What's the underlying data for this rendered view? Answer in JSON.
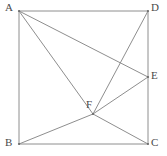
{
  "figure": {
    "width": 167,
    "height": 156,
    "stroke_color": "#8e8e8e",
    "label_color": "#4a4a4a",
    "background_color": "#ffffff"
  },
  "points": {
    "A": {
      "label": "A",
      "x": 19,
      "y": 11,
      "label_x": 5,
      "label_y": 2
    },
    "B": {
      "label": "B",
      "x": 19,
      "y": 144,
      "label_x": 5,
      "label_y": 137
    },
    "C": {
      "label": "C",
      "x": 148,
      "y": 144,
      "label_x": 151,
      "label_y": 137
    },
    "D": {
      "label": "D",
      "x": 148,
      "y": 11,
      "label_x": 151,
      "label_y": 2
    },
    "E": {
      "label": "E",
      "x": 148,
      "y": 77,
      "label_x": 151,
      "label_y": 70
    },
    "F": {
      "label": "F",
      "x": 93,
      "y": 114,
      "label_x": 86,
      "label_y": 99
    }
  },
  "segments": [
    {
      "name": "side-AD",
      "from": "A",
      "to": "D",
      "kind": "square-side"
    },
    {
      "name": "side-AB",
      "from": "A",
      "to": "B",
      "kind": "square-side"
    },
    {
      "name": "side-BC",
      "from": "B",
      "to": "C",
      "kind": "square-side"
    },
    {
      "name": "side-DC",
      "from": "D",
      "to": "C",
      "kind": "square-side"
    },
    {
      "name": "segment-AE",
      "from": "A",
      "to": "E",
      "kind": "cevian"
    },
    {
      "name": "segment-AF",
      "from": "A",
      "to": "F",
      "kind": "cevian"
    },
    {
      "name": "segment-DF",
      "from": "D",
      "to": "F",
      "kind": "cevian"
    },
    {
      "name": "segment-EF",
      "from": "E",
      "to": "F",
      "kind": "cevian"
    },
    {
      "name": "segment-BF",
      "from": "B",
      "to": "F",
      "kind": "cevian"
    },
    {
      "name": "segment-FC",
      "from": "F",
      "to": "C",
      "kind": "cevian"
    }
  ],
  "vertex_dots": [
    "A",
    "B",
    "C",
    "D",
    "E",
    "F"
  ]
}
